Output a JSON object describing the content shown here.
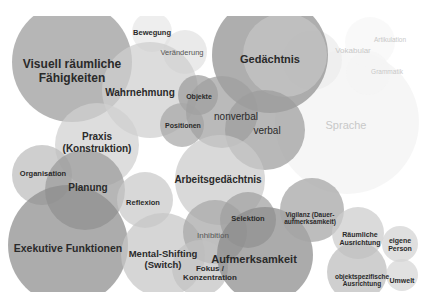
{
  "diagram": {
    "type": "overlapping-bubble-chart",
    "topic": "cognitive functions",
    "labels": {
      "visuell": "Visuell räumliche\nFähigkeiten",
      "bewegung": "Bewegung",
      "veraenderung": "Veränderung",
      "wahrnehmung": "Wahrnehmung",
      "objekte": "Objekte",
      "positionen": "Positionen",
      "gedaechtnis": "Gedächtnis",
      "nonverbal": "nonverbal",
      "verbal": "verbal",
      "vokabular": "Vokabular",
      "artikulation": "Artikulation",
      "grammatik": "Grammatik",
      "sprache": "Sprache",
      "praxis": "Praxis\n(Konstruktion)",
      "organisation": "Organisation",
      "planung": "Planung",
      "reflexion": "Reflexion",
      "arbeitsgedaechtnis": "Arbeitsgedächtnis",
      "exekutive": "Exekutive Funktionen",
      "mental_shifting": "Mental-Shifting\n(Switch)",
      "inhibition": "Inhibition",
      "selektion": "Selektion",
      "fokus": "Fokus /\nKonzentration",
      "aufmerksamkeit": "Aufmerksamkeit",
      "vigilanz": "Vigilanz (Dauer-\naufmerksamkeit)",
      "raeumliche": "Räumliche\nAusrichtung",
      "eigene_person": "eigene\nPerson",
      "objektspezifische": "objektspezifische\nAusrichtung",
      "umwelt": "Umwelt"
    },
    "bubbles": [
      {
        "id": "sprache",
        "x": 347,
        "y": 122,
        "r": 72,
        "color": "#f2f2f2"
      },
      {
        "id": "vokabular",
        "x": 312,
        "y": 60,
        "r": 30,
        "color": "#ececec"
      },
      {
        "id": "artikulation",
        "x": 370,
        "y": 42,
        "r": 25,
        "color": "#f6f6f6"
      },
      {
        "id": "grammatik",
        "x": 368,
        "y": 73,
        "r": 22,
        "color": "#f4f4f4"
      },
      {
        "id": "gedaechtnis",
        "x": 270,
        "y": 55,
        "r": 58,
        "color": "#8f8f8f"
      },
      {
        "id": "gedaechtnis_inner",
        "x": 285,
        "y": 55,
        "r": 42,
        "color": "#c6c6c6"
      },
      {
        "id": "visuell",
        "x": 72,
        "y": 62,
        "r": 60,
        "color": "#9a9a9a"
      },
      {
        "id": "bewegung",
        "x": 152,
        "y": 32,
        "r": 20,
        "color": "#e8e8e8"
      },
      {
        "id": "veraenderung",
        "x": 185,
        "y": 52,
        "r": 22,
        "color": "#e2e2e2"
      },
      {
        "id": "wahrnehmung",
        "x": 150,
        "y": 90,
        "r": 48,
        "color": "#cfcfcf"
      },
      {
        "id": "objekte",
        "x": 198,
        "y": 95,
        "r": 20,
        "color": "#9c9c9c"
      },
      {
        "id": "positionen",
        "x": 182,
        "y": 125,
        "r": 22,
        "color": "#a8a8a8"
      },
      {
        "id": "nonverbal",
        "x": 222,
        "y": 112,
        "r": 36,
        "color": "#a0a0a0"
      },
      {
        "id": "verbal",
        "x": 265,
        "y": 130,
        "r": 40,
        "color": "#9c9c9c"
      },
      {
        "id": "praxis",
        "x": 97,
        "y": 145,
        "r": 42,
        "color": "#d0d0d0"
      },
      {
        "id": "organisation",
        "x": 42,
        "y": 175,
        "r": 30,
        "color": "#bdbdbd"
      },
      {
        "id": "planung",
        "x": 85,
        "y": 190,
        "r": 40,
        "color": "#9a9a9a"
      },
      {
        "id": "reflexion",
        "x": 145,
        "y": 200,
        "r": 28,
        "color": "#c9c9c9"
      },
      {
        "id": "arbeitsgedaechtnis",
        "x": 220,
        "y": 180,
        "r": 45,
        "color": "#cbcbcb"
      },
      {
        "id": "exekutive",
        "x": 68,
        "y": 245,
        "r": 60,
        "color": "#8c8c8c"
      },
      {
        "id": "mental_shifting",
        "x": 163,
        "y": 255,
        "r": 42,
        "color": "#c6c6c6"
      },
      {
        "id": "inhibition",
        "x": 215,
        "y": 232,
        "r": 32,
        "color": "#a6a6a6"
      },
      {
        "id": "fokus",
        "x": 200,
        "y": 268,
        "r": 28,
        "color": "#c2c2c2"
      },
      {
        "id": "selektion",
        "x": 248,
        "y": 220,
        "r": 28,
        "color": "#9f9f9f"
      },
      {
        "id": "aufmerksamkeit",
        "x": 265,
        "y": 255,
        "r": 48,
        "color": "#8a8a8a"
      },
      {
        "id": "vigilanz",
        "x": 312,
        "y": 210,
        "r": 32,
        "color": "#a4a4a4"
      },
      {
        "id": "raeumliche",
        "x": 358,
        "y": 233,
        "r": 26,
        "color": "#cccccc"
      },
      {
        "id": "eigene_person",
        "x": 400,
        "y": 244,
        "r": 18,
        "color": "#d2d2d2"
      },
      {
        "id": "objektspezifische",
        "x": 357,
        "y": 272,
        "r": 30,
        "color": "#bcbcbc"
      },
      {
        "id": "umwelt",
        "x": 402,
        "y": 275,
        "r": 16,
        "color": "#d6d6d6"
      }
    ]
  }
}
